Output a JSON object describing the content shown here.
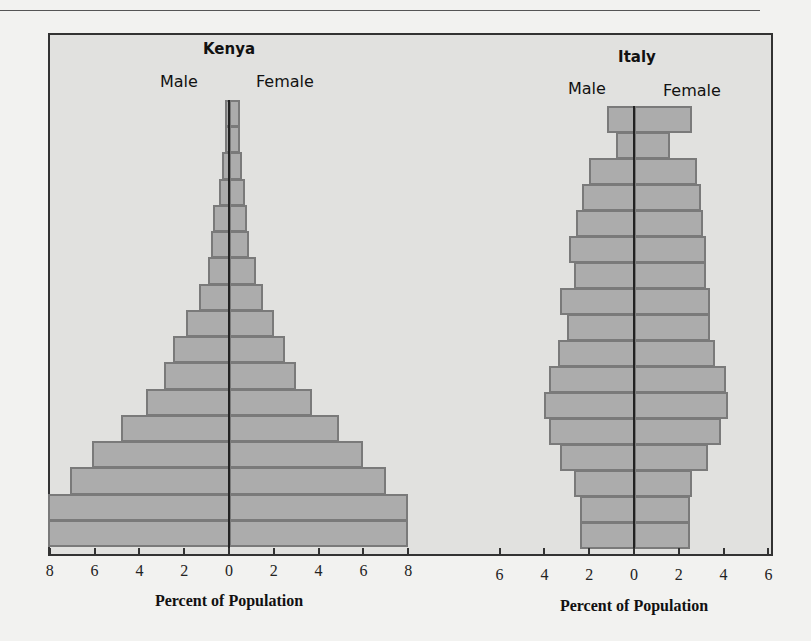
{
  "chart_data": [
    {
      "type": "bar",
      "orientation": "horizontal",
      "subtype": "population-pyramid",
      "title": "Kenya",
      "legend": [
        "Male",
        "Female"
      ],
      "xlabel": "Percent of Population",
      "ylabel": "",
      "xlim": [
        -8,
        8
      ],
      "xticks": [
        "8",
        "6",
        "4",
        "2",
        "0",
        "2",
        "4",
        "6",
        "8"
      ],
      "grid": false,
      "age_groups_top_to_bottom": 17,
      "series": [
        {
          "name": "Male",
          "values": [
            0.2,
            0.2,
            0.3,
            0.45,
            0.7,
            0.8,
            0.95,
            1.35,
            1.9,
            2.5,
            2.9,
            3.7,
            4.8,
            6.1,
            7.1,
            8.1,
            8.1
          ]
        },
        {
          "name": "Female",
          "values": [
            0.5,
            0.5,
            0.6,
            0.7,
            0.8,
            0.9,
            1.2,
            1.5,
            2.0,
            2.5,
            3.0,
            3.7,
            4.9,
            6.0,
            7.0,
            8.0,
            8.0
          ]
        }
      ]
    },
    {
      "type": "bar",
      "orientation": "horizontal",
      "subtype": "population-pyramid",
      "title": "Italy",
      "legend": [
        "Male",
        "Female"
      ],
      "xlabel": "Percent of Population",
      "ylabel": "",
      "xlim": [
        -6,
        6
      ],
      "xticks": [
        "6",
        "4",
        "2",
        "0",
        "2",
        "4",
        "6"
      ],
      "grid": false,
      "age_groups_top_to_bottom": 17,
      "series": [
        {
          "name": "Male",
          "values": [
            1.2,
            0.8,
            2.0,
            2.3,
            2.6,
            2.9,
            2.7,
            3.3,
            3.0,
            3.4,
            3.8,
            4.0,
            3.8,
            3.3,
            2.7,
            2.4,
            2.4
          ]
        },
        {
          "name": "Female",
          "values": [
            2.6,
            1.6,
            2.8,
            3.0,
            3.1,
            3.2,
            3.2,
            3.4,
            3.4,
            3.6,
            4.1,
            4.2,
            3.9,
            3.3,
            2.6,
            2.5,
            2.5
          ]
        }
      ]
    }
  ],
  "labels": {
    "kenya_title": "Kenya",
    "italy_title": "Italy",
    "male": "Male",
    "female": "Female",
    "xlabel": "Percent of Population"
  },
  "colors": {
    "bar_fill": "#acacac",
    "bar_border": "#7a7a7a",
    "panel": "#e1e1df",
    "page": "#f2f2f0",
    "axis": "#222222"
  }
}
